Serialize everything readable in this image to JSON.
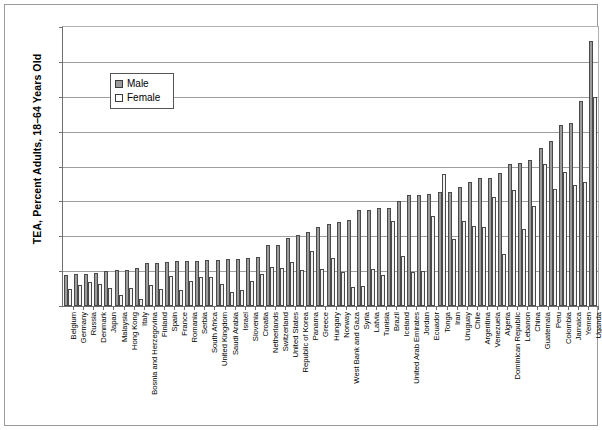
{
  "chart_data": {
    "type": "bar",
    "title": "",
    "xlabel": "",
    "ylabel": "TEA, Percent Adults, 18–64 Years Old",
    "ylim": [
      0,
      40
    ],
    "ytick_labels": [
      "0%",
      "5%",
      "10%",
      "15%",
      "20%",
      "25%",
      "30%",
      "35%",
      "40%"
    ],
    "ytick_values": [
      0,
      5,
      10,
      15,
      20,
      25,
      30,
      35,
      40
    ],
    "grid": true,
    "legend_position": "upper-left-inside",
    "legend": [
      "Male",
      "Female"
    ],
    "categories": [
      "Belgium",
      "Germany",
      "Russia",
      "Denmark",
      "Japan",
      "Malaysia",
      "Hong Kong",
      "Italy",
      "Bosnia and Herzegovina",
      "Finland",
      "Spain",
      "France",
      "Romania",
      "Serbia",
      "South Africa",
      "United Kingdom",
      "Saudi Arabia",
      "Israel",
      "Slovenia",
      "Croatia",
      "Netherlands",
      "Switzerland",
      "United States",
      "Republic of Korea",
      "Panama",
      "Greece",
      "Hungary",
      "Norway",
      "West Bank and Gaza",
      "Syria",
      "Latvia",
      "Tunisia",
      "Brazil",
      "Iceland",
      "United Arab Emirates",
      "Jordan",
      "Ecuador",
      "Tonga",
      "Iran",
      "Uruguay",
      "Chile",
      "Argentina",
      "Venezuela",
      "Algeria",
      "Dominican Republic",
      "Lebanon",
      "China",
      "Guatemala",
      "Peru",
      "Colombia",
      "Jamaica",
      "Yemen",
      "Uganda"
    ],
    "series": [
      {
        "name": "Male",
        "color": "#9b9b9b",
        "values": [
          4.4,
          4.6,
          4.6,
          4.8,
          5.0,
          5.1,
          5.2,
          5.4,
          6.2,
          6.2,
          6.3,
          6.4,
          6.4,
          6.5,
          6.6,
          6.6,
          6.7,
          6.8,
          6.9,
          7.0,
          8.8,
          8.8,
          9.8,
          10.2,
          10.6,
          11.3,
          11.7,
          12.0,
          12.3,
          13.8,
          13.8,
          14.0,
          14.0,
          15.1,
          15.9,
          15.9,
          16.0,
          16.3,
          16.4,
          17.0,
          17.8,
          18.3,
          18.3,
          19.0,
          20.4,
          20.5,
          20.9,
          22.6,
          23.6,
          25.9,
          26.3,
          29.4,
          38.0
        ]
      },
      {
        "name": "Female",
        "color": "#f2f2f2",
        "values": [
          2.5,
          3.0,
          3.5,
          3.2,
          2.6,
          1.6,
          2.6,
          1.0,
          3.0,
          2.4,
          4.3,
          2.3,
          3.6,
          4.2,
          4.1,
          3.1,
          2.0,
          2.3,
          3.6,
          4.6,
          5.6,
          5.4,
          6.3,
          5.2,
          7.9,
          5.3,
          6.9,
          4.9,
          2.7,
          2.9,
          5.3,
          4.4,
          12.2,
          7.1,
          4.9,
          5.0,
          12.9,
          18.9,
          9.6,
          12.2,
          11.5,
          11.3,
          15.6,
          7.4,
          16.6,
          11.1,
          14.3,
          20.4,
          16.8,
          19.2,
          17.3,
          17.8,
          30.0
        ]
      }
    ]
  }
}
